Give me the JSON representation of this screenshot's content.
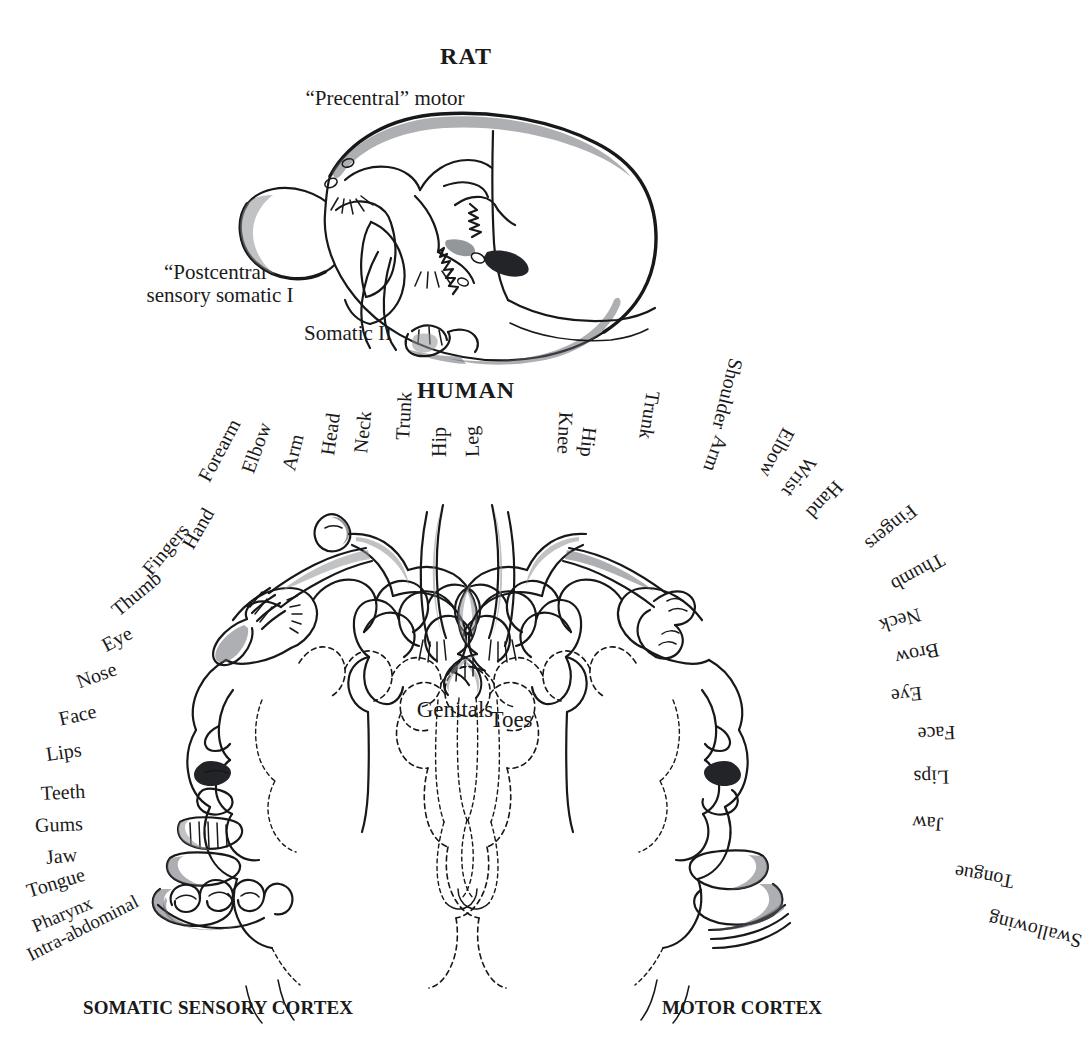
{
  "figure": {
    "kind": "anatomical-diagram",
    "background_color": "#ffffff",
    "ink_color": "#17181a"
  },
  "rat": {
    "title": "RAT",
    "labels": {
      "precentral": "“Precentral” motor",
      "postcentral_line1": "“Postcentral”",
      "postcentral_line2": "sensory somatic I",
      "somatic2": "Somatic II",
      "visual": "Visual",
      "auditory1": "Auditory I",
      "auditory2": "Auditory II"
    }
  },
  "human": {
    "title": "HUMAN",
    "captions": {
      "left": "SOMATIC SENSORY CORTEX",
      "right": "MOTOR CORTEX"
    },
    "center_labels": {
      "genitals": "Genitals",
      "toes": "Toes"
    },
    "sensory_labels": [
      "Intra-abdominal",
      "Pharynx",
      "Tongue",
      "Jaw",
      "Gums",
      "Teeth",
      "Lips",
      "Face",
      "Nose",
      "Eye",
      "Thumb",
      "Fingers",
      "Hand",
      "Forearm",
      "Elbow",
      "Arm",
      "Head",
      "Neck",
      "Trunk",
      "Hip",
      "Leg"
    ],
    "motor_labels": [
      "Knee",
      "Hip",
      "Trunk",
      "Shoulder",
      "Arm",
      "Elbow",
      "Wrist",
      "Hand",
      "Fingers",
      "Thumb",
      "Neck",
      "Brow",
      "Eye",
      "Face",
      "Lips",
      "Jaw",
      "Tongue",
      "Swallowing"
    ]
  }
}
